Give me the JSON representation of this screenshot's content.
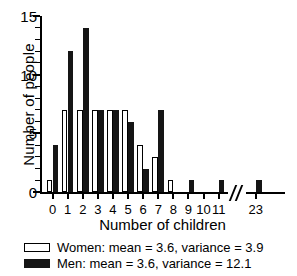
{
  "chart_data": {
    "type": "bar",
    "title": "",
    "xlabel": "Number of children",
    "ylabel": "Number of people",
    "categories": [
      "0",
      "1",
      "2",
      "3",
      "4",
      "5",
      "6",
      "7",
      "8",
      "9",
      "10",
      "11",
      "23"
    ],
    "series": [
      {
        "name": "Women",
        "values": [
          1,
          7,
          7,
          7,
          7,
          7,
          4,
          3,
          1,
          0,
          0,
          0,
          0
        ],
        "fill": "#ffffff",
        "edge": "#000000"
      },
      {
        "name": "Men",
        "values": [
          4,
          12,
          14,
          7,
          7,
          6,
          2,
          7,
          0,
          1,
          0,
          1,
          1
        ],
        "fill": "#151515",
        "edge": "#151515"
      }
    ],
    "ylim": [
      0,
      15
    ],
    "yticks": [
      0,
      5,
      10,
      15
    ],
    "yticklabels": [
      "0",
      "5",
      "10",
      "15"
    ],
    "yminor_step": 1,
    "grid": false,
    "axis_break": {
      "present": true,
      "between": [
        "11",
        "23"
      ],
      "marker": "//"
    },
    "legend": {
      "position": "below-axes",
      "entries": [
        {
          "swatch": "women-open-square",
          "label": "Women: mean = 3.6, variance = 3.9"
        },
        {
          "swatch": "men-filled-square",
          "label": "Men: mean = 3.6, variance = 12.1"
        }
      ]
    },
    "annotations": [
      {
        "series": "Women",
        "mean": 3.6,
        "variance": 3.9
      },
      {
        "series": "Men",
        "mean": 3.6,
        "variance": 12.1
      }
    ]
  }
}
